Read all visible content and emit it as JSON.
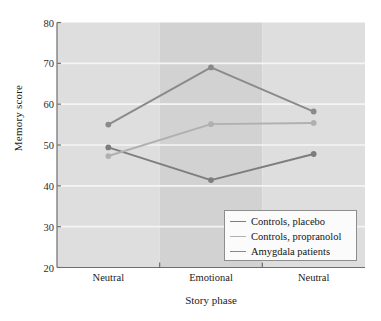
{
  "chart_data": {
    "type": "line",
    "title": "",
    "xlabel": "Story phase",
    "ylabel": "Memory score",
    "categories": [
      "Neutral",
      "Emotional",
      "Neutral"
    ],
    "ylim": [
      20,
      80
    ],
    "yticks": [
      20,
      30,
      40,
      50,
      60,
      70,
      80
    ],
    "grid": true,
    "legend_position": "bottom-right",
    "background_bands": [
      "#dedede",
      "#d2d2d2",
      "#dedede"
    ],
    "series": [
      {
        "name": "Controls, placebo",
        "color": "#7d7d7d",
        "values": [
          49.4,
          41.4,
          47.8
        ]
      },
      {
        "name": "Controls, propranolol",
        "color": "#b0b0b0",
        "values": [
          47.3,
          55.1,
          55.4
        ]
      },
      {
        "name": "Amygdala patients",
        "color": "#8a8a8a",
        "values": [
          55.0,
          69.0,
          58.2
        ]
      }
    ]
  },
  "axes": {
    "y_tick_labels": [
      "80",
      "70",
      "60",
      "50",
      "40",
      "30",
      "20"
    ],
    "x_tick_labels": [
      "Neutral",
      "Emotional",
      "Neutral"
    ],
    "y_axis_title": "Memory score",
    "x_axis_title": "Story phase"
  },
  "legend": {
    "items": [
      {
        "label": "Controls, placebo",
        "color": "#7d7d7d"
      },
      {
        "label": "Controls, propranolol",
        "color": "#b0b0b0"
      },
      {
        "label": "Amygdala patients",
        "color": "#8a8a8a"
      }
    ]
  },
  "colors": {
    "plot_band_light": "#dedede",
    "plot_band_dark": "#d2d2d2",
    "gridline": "#f4f4f4",
    "axis": "#6e6e6e",
    "text": "#1b1b1b"
  }
}
